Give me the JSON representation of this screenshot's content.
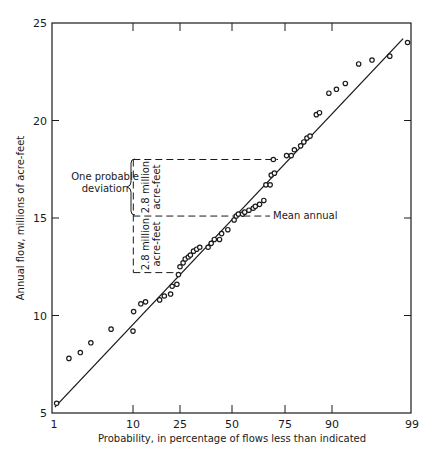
{
  "chart_data": {
    "type": "scatter",
    "title": "",
    "xlabel": "Probability, in percentage of flows less than indicated",
    "ylabel": "Annual flow, millions of acre-feet",
    "x_scale": "probability",
    "x_ticks": [
      1,
      10,
      25,
      50,
      75,
      90,
      99
    ],
    "y_ticks": [
      5,
      10,
      15,
      20,
      25
    ],
    "xlim": [
      1,
      99
    ],
    "ylim": [
      5,
      25
    ],
    "grid": false,
    "legend": null,
    "series": [
      {
        "name": "Observed annual flows",
        "marker": "open-circle",
        "points": [
          [
            1.3,
            5.5
          ],
          [
            2.7,
            7.8
          ],
          [
            4.0,
            8.1
          ],
          [
            5.2,
            8.6
          ],
          [
            7.5,
            9.3
          ],
          [
            10.0,
            9.2
          ],
          [
            10.2,
            10.2
          ],
          [
            12.5,
            10.6
          ],
          [
            14.0,
            10.7
          ],
          [
            18.5,
            10.8
          ],
          [
            20.0,
            11.0
          ],
          [
            22.0,
            11.1
          ],
          [
            22.5,
            11.5
          ],
          [
            24.0,
            11.6
          ],
          [
            24.5,
            12.1
          ],
          [
            25.0,
            12.5
          ],
          [
            26.5,
            12.7
          ],
          [
            27.5,
            12.9
          ],
          [
            29.0,
            13.0
          ],
          [
            30.0,
            13.1
          ],
          [
            31.5,
            13.3
          ],
          [
            33.0,
            13.4
          ],
          [
            34.5,
            13.5
          ],
          [
            38.5,
            13.5
          ],
          [
            40.0,
            13.7
          ],
          [
            41.5,
            13.9
          ],
          [
            44.0,
            13.9
          ],
          [
            45.0,
            14.2
          ],
          [
            48.0,
            14.4
          ],
          [
            51.0,
            14.9
          ],
          [
            52.0,
            15.1
          ],
          [
            53.0,
            15.2
          ],
          [
            55.0,
            15.2
          ],
          [
            56.0,
            15.3
          ],
          [
            58.0,
            15.4
          ],
          [
            60.0,
            15.5
          ],
          [
            61.0,
            15.6
          ],
          [
            63.0,
            15.7
          ],
          [
            65.0,
            15.9
          ],
          [
            66.0,
            16.7
          ],
          [
            68.0,
            16.7
          ],
          [
            68.5,
            17.2
          ],
          [
            70.0,
            17.3
          ],
          [
            69.5,
            18.0
          ],
          [
            75.5,
            18.2
          ],
          [
            77.0,
            18.2
          ],
          [
            78.0,
            18.5
          ],
          [
            80.0,
            18.7
          ],
          [
            81.0,
            18.9
          ],
          [
            82.0,
            19.1
          ],
          [
            83.0,
            19.2
          ],
          [
            85.0,
            20.3
          ],
          [
            86.0,
            20.4
          ],
          [
            89.0,
            21.4
          ],
          [
            90.5,
            21.6
          ],
          [
            91.5,
            21.9
          ],
          [
            93.0,
            22.9
          ],
          [
            94.5,
            23.1
          ],
          [
            96.5,
            23.3
          ],
          [
            98.5,
            24.0
          ]
        ]
      },
      {
        "name": "Fitted line",
        "type": "line",
        "points": [
          [
            1.1,
            5.3
          ],
          [
            98.0,
            24.2
          ]
        ]
      }
    ],
    "reference_lines": {
      "mean_annual": 15.1,
      "upper": 18.0,
      "lower": 12.2,
      "vertical_at_probability": 10.1
    },
    "annotations": {
      "mean_label": "Mean annual",
      "deviation_label_line1": "One probable",
      "deviation_label_line2": "deviation",
      "upper_range_line1": "2.8 million",
      "upper_range_line2": "acre-feet",
      "lower_range_line1": "2.8 million",
      "lower_range_line2": "acre-feet"
    }
  },
  "layout": {
    "x_tick_px": {
      "1": 54,
      "10": 133,
      "25": 180,
      "50": 232,
      "75": 285,
      "90": 332,
      "99": 412
    },
    "plot_left": 52,
    "plot_right": 411,
    "plot_top": 23,
    "plot_bottom": 413,
    "y_px_per_unit": 19.5,
    "y_zero_value": 5
  }
}
